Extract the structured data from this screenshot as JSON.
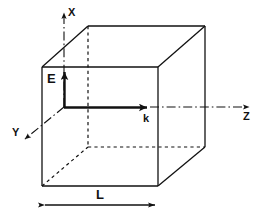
{
  "figure": {
    "type": "physics-diagram",
    "background_color": "#ffffff",
    "stroke_color": "#111111",
    "width": 261,
    "height": 216
  },
  "axes": [
    {
      "id": "x",
      "label": "X",
      "label_x": 68,
      "label_y": 16,
      "direction": "up",
      "line": {
        "x1": 64,
        "y1": 107,
        "x2": 64,
        "y2": 11
      },
      "style": "dash-dot",
      "arrow": true
    },
    {
      "id": "y",
      "label": "Y",
      "label_x": 12,
      "label_y": 136,
      "direction": "down-left",
      "line": {
        "x1": 64,
        "y1": 107,
        "x2": 23,
        "y2": 141
      },
      "style": "dash-dot",
      "arrow": true
    },
    {
      "id": "z",
      "label": "Z",
      "label_x": 243,
      "label_y": 120,
      "direction": "right",
      "line": {
        "x1": 64,
        "y1": 107,
        "x2": 251,
        "y2": 107
      },
      "style": "dash-dot",
      "arrow": true
    }
  ],
  "vectors": [
    {
      "id": "E",
      "label": "E",
      "label_x": 47,
      "label_y": 83,
      "description": "electric field vector pointing along x",
      "line": {
        "x1": 64,
        "y1": 107,
        "x2": 64,
        "y2": 70
      },
      "style": "solid-thick",
      "arrow": true
    },
    {
      "id": "k",
      "label": "k",
      "label_x": 143,
      "label_y": 122,
      "description": "wave vector pointing along z",
      "line": {
        "x1": 64,
        "y1": 107,
        "x2": 150,
        "y2": 107
      },
      "style": "solid-thick",
      "arrow": true
    }
  ],
  "cube": {
    "description": "cubic cavity drawn in oblique projection",
    "front_face": {
      "left": 42,
      "top": 67,
      "right": 158,
      "bottom": 186
    },
    "back_face": {
      "left": 88,
      "top": 25,
      "right": 205,
      "bottom": 147
    },
    "visible_edges_style": "solid",
    "hidden_edges_style": "dashed"
  },
  "dimension": {
    "id": "L",
    "label": "L",
    "label_x": 96,
    "label_y": 199,
    "line": {
      "x1": 42,
      "y1": 205,
      "x2": 158,
      "y2": 205
    },
    "arrows": "both",
    "description": "cavity side length"
  }
}
